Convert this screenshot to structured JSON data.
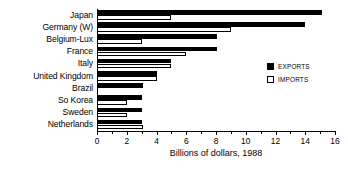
{
  "chart_data": {
    "type": "bar",
    "orientation": "horizontal",
    "title": "",
    "xlabel": "Billions of dollars, 1988",
    "ylabel": "",
    "xlim": [
      0,
      16
    ],
    "xticks": [
      0,
      2,
      4,
      6,
      8,
      10,
      12,
      14,
      16
    ],
    "xticklabels": [
      "0",
      "2",
      "4",
      "6",
      "8",
      "10",
      "12",
      "14",
      "16"
    ],
    "grid": false,
    "legend_position": "right",
    "categories": [
      "Japan",
      "Germany (W)",
      "Belgium-Lux",
      "France",
      "Italy",
      "United Kingdom",
      "Brazil",
      "So Korea",
      "Sweden",
      "Netherlands"
    ],
    "series": [
      {
        "name": "EXPORTS",
        "color": "#000000",
        "values": [
          15.1,
          14.0,
          8.1,
          8.1,
          5.0,
          4.0,
          3.1,
          3.0,
          3.0,
          3.0
        ]
      },
      {
        "name": "IMPORTS",
        "color": "#ffffff",
        "values": [
          5.0,
          9.0,
          3.0,
          6.0,
          5.0,
          4.0,
          0,
          2.0,
          2.0,
          3.1
        ]
      }
    ]
  },
  "legend": {
    "items": [
      {
        "label": "EXPORTS",
        "swatch": "filled-black-square"
      },
      {
        "label": "IMPORTS",
        "swatch": "open-white-square"
      }
    ]
  }
}
